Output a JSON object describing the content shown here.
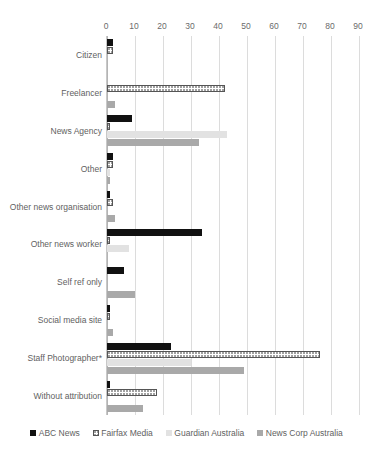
{
  "chart_data": {
    "type": "bar",
    "orientation": "horizontal",
    "title": "",
    "subtitle": "",
    "xlabel": "",
    "ylabel": "",
    "xlim": [
      0,
      90
    ],
    "xticks": [
      0,
      10,
      20,
      30,
      40,
      50,
      60,
      70,
      80,
      90
    ],
    "xtick_labels": [
      "0",
      "10",
      "20",
      "30",
      "40",
      "50",
      "60",
      "70",
      "80",
      "90"
    ],
    "grid": true,
    "grid_axis": "x",
    "legend_position": "bottom",
    "axis_label_position": "top",
    "categories": [
      "Citizen",
      "Freelancer",
      "News Agency",
      "Other",
      "Other news organisation",
      "Other news worker",
      "Self ref only",
      "Social media site",
      "Staff Photographer*",
      "Without attribution"
    ],
    "series": [
      {
        "name": "ABC News",
        "color": "#111111",
        "pattern": "solid",
        "values": [
          2,
          0,
          9,
          2,
          1,
          34,
          6,
          1,
          23,
          1
        ]
      },
      {
        "name": "Fairfax Media",
        "color": "#ffffff",
        "pattern": "dotted",
        "values": [
          2,
          42,
          1,
          2,
          2,
          1,
          0,
          1,
          76,
          18
        ]
      },
      {
        "name": "Guardian Australia",
        "color": "#e2e2e2",
        "pattern": "solid",
        "values": [
          0,
          0,
          43,
          1,
          0,
          8,
          0,
          0,
          30,
          0
        ]
      },
      {
        "name": "News Corp Australia",
        "color": "#a9a9a9",
        "pattern": "solid",
        "values": [
          0,
          3,
          33,
          1,
          3,
          0,
          10,
          2,
          49,
          13
        ]
      }
    ],
    "footnote": ""
  }
}
